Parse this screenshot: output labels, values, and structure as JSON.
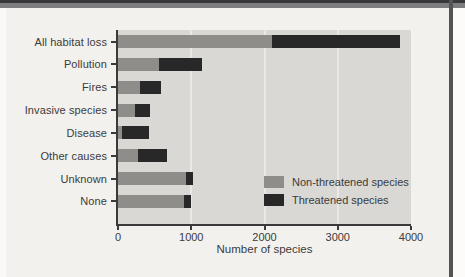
{
  "figure": {
    "background": "#f3f1ee",
    "frame_top_color": "#38383a",
    "frame_right_color": "#545456"
  },
  "chart_data": {
    "type": "bar",
    "orientation": "horizontal",
    "stacked": true,
    "title": "",
    "categories": [
      "All habitat loss",
      "Pollution",
      "Fires",
      "Invasive species",
      "Disease",
      "Other causes",
      "Unknown",
      "None"
    ],
    "series": [
      {
        "name": "Non-threatened species",
        "color": "#8e8d8a",
        "values": [
          2100,
          560,
          300,
          230,
          50,
          270,
          930,
          900
        ]
      },
      {
        "name": "Threatened species",
        "color": "#282828",
        "values": [
          1750,
          580,
          290,
          210,
          370,
          400,
          100,
          90
        ]
      }
    ],
    "xlabel": "Number of species",
    "xlim": [
      0,
      4000
    ],
    "xticks": [
      0,
      1000,
      2000,
      3000,
      4000
    ],
    "gridlines": [
      1000,
      2000,
      3000
    ],
    "grid_color": "#eae8e5",
    "plot_background": "#d9d8d5",
    "axis_color": "#3a3a3a",
    "legend_position": "lower right",
    "legend_labels": [
      "Non-threatened species",
      "Threatened species"
    ]
  }
}
